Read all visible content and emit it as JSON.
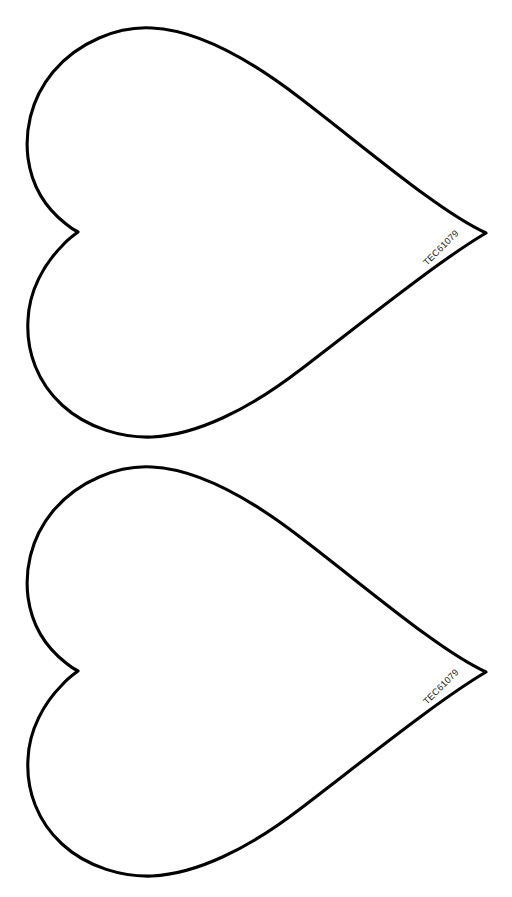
{
  "page": {
    "background_color": "#ffffff",
    "width": 512,
    "height": 897
  },
  "style": {
    "outline_color": "#000000",
    "outline_width": 3.1,
    "fill_color": "#ffffff",
    "label_color": "#1a1a1a",
    "label_font_size": 9.2
  },
  "shapes": [
    {
      "name": "heart-top",
      "label": "TEC61079",
      "label_rotation_deg": -45,
      "label_x": 427,
      "label_y": 266,
      "geometry": {
        "top_apex": [
          152,
          28
        ],
        "left_lobe_extreme": [
          27,
          150
        ],
        "cleft_notch": [
          78,
          232
        ],
        "bottom_extreme": [
          152,
          437
        ],
        "right_tip": [
          486,
          233
        ]
      },
      "path": "M 152 28 C 118 26 78 42 53 72 C 29 101 25 134 28 158 C 32 188 48 210 66 224 C 72 229 76 231 78 232 C 74 235 68 239 62 246 C 44 264 29 291 28 320 C 26 352 38 383 62 405 C 88 429 124 438 152 437 C 196 435 248 410 300 370 C 368 318 440 260 486 233 C 440 212 368 150 300 98 C 248 58 196 30 152 28 Z"
    },
    {
      "name": "heart-bottom",
      "label": "TEC61079",
      "label_rotation_deg": -45,
      "label_x": 427,
      "label_y": 705,
      "geometry": {
        "top_apex": [
          152,
          467
        ],
        "left_lobe_extreme": [
          27,
          589
        ],
        "cleft_notch": [
          78,
          671
        ],
        "bottom_extreme": [
          152,
          876
        ],
        "right_tip": [
          486,
          672
        ]
      },
      "path": "M 152 467 C 118 465 78 481 53 511 C 29 540 25 573 28 597 C 32 627 48 649 66 663 C 72 668 76 670 78 671 C 74 674 68 678 62 685 C 44 703 29 730 28 759 C 26 791 38 822 62 844 C 88 868 124 877 152 876 C 196 874 248 849 300 809 C 368 757 440 699 486 672 C 440 651 368 589 300 537 C 248 497 196 469 152 467 Z"
    }
  ]
}
